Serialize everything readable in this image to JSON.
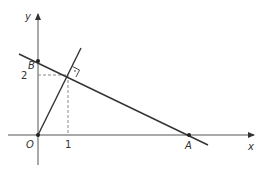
{
  "diagram": {
    "type": "coordinate-geometry",
    "axes": {
      "x_label": "x",
      "y_label": "y",
      "origin_label": "O"
    },
    "ticks": {
      "x": [
        "1"
      ],
      "y": [
        "2"
      ]
    },
    "points": [
      {
        "name": "O",
        "coords": [
          0,
          0
        ]
      },
      {
        "name": "A",
        "coords": [
          "a",
          0
        ]
      },
      {
        "name": "B",
        "coords": [
          0,
          "b"
        ]
      },
      {
        "name": "P",
        "coords": [
          1,
          2
        ]
      }
    ],
    "lines": [
      {
        "name": "line-AB",
        "through": [
          "B",
          "P",
          "A"
        ]
      },
      {
        "name": "line-OP",
        "through": [
          "O",
          "P"
        ],
        "perpendicular_to": "line-AB"
      }
    ],
    "annotations": [
      "right-angle at (1, 2)",
      "dashed projections from (1,2) to axes"
    ],
    "colors": {
      "line": "#333333",
      "axis": "#555555",
      "dash": "#888888"
    }
  }
}
